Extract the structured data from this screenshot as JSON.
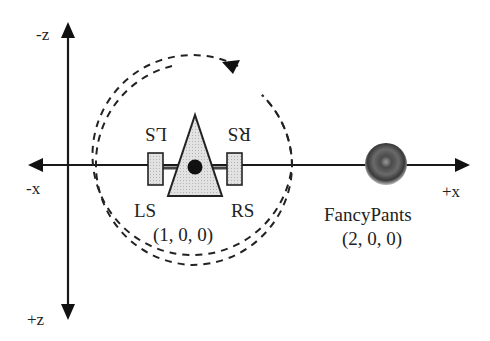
{
  "axes": {
    "neg_z": "-z",
    "pos_z": "+z",
    "neg_x": "-x",
    "pos_x": "+x"
  },
  "listener": {
    "left_speaker_label": "LS",
    "right_speaker_label": "RS",
    "left_speaker_label_flipped": "LS",
    "right_speaker_label_flipped": "RS",
    "position": "(1, 0, 0)"
  },
  "source": {
    "name": "FancyPants",
    "position": "(2, 0, 0)"
  },
  "colors": {
    "line": "#1a1a1a",
    "fill_light": "#d9d9d9",
    "sphere_dark": "#3a3a3a",
    "background": "#ffffff"
  }
}
